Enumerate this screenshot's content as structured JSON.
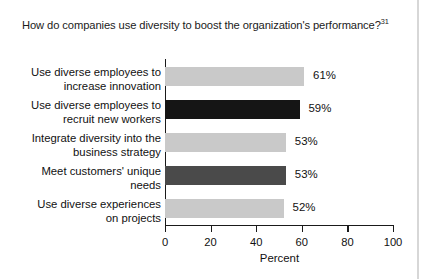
{
  "chart_data": {
    "type": "bar",
    "orientation": "horizontal",
    "title": "How do companies use diversity to boost the organization's performance?",
    "title_superscript": "31",
    "xlabel": "Percent",
    "ylabel": "",
    "xlim": [
      0,
      100
    ],
    "xticks": [
      0,
      20,
      40,
      60,
      80,
      100
    ],
    "xtick_labels": [
      "0",
      "20",
      "40",
      "60",
      "80",
      "100"
    ],
    "grid": false,
    "legend": "none",
    "categories": [
      "Use diverse employees to increase innovation",
      "Use diverse employees to recruit new workers",
      "Integrate diversity into the business strategy",
      "Meet customers' unique needs",
      "Use diverse experiences on projects"
    ],
    "category_lines": [
      [
        "Use diverse employees to",
        "increase innovation"
      ],
      [
        "Use diverse employees to",
        "recruit new workers"
      ],
      [
        "Integrate diversity into the",
        "business strategy"
      ],
      [
        "Meet customers' unique",
        "needs"
      ],
      [
        "Use diverse experiences",
        "on projects"
      ]
    ],
    "values": [
      61,
      59,
      53,
      53,
      52
    ],
    "value_labels": [
      "61%",
      "59%",
      "53%",
      "53%",
      "52%"
    ],
    "bar_colors": [
      "#c9c9c9",
      "#151515",
      "#c9c9c9",
      "#4a4a4a",
      "#c9c9c9"
    ]
  },
  "colors": {
    "axis": "#1a1a1a",
    "text": "#111111",
    "background": "#ffffff",
    "light_bar": "#c9c9c9",
    "black_bar": "#151515",
    "dark_bar": "#4a4a4a"
  }
}
